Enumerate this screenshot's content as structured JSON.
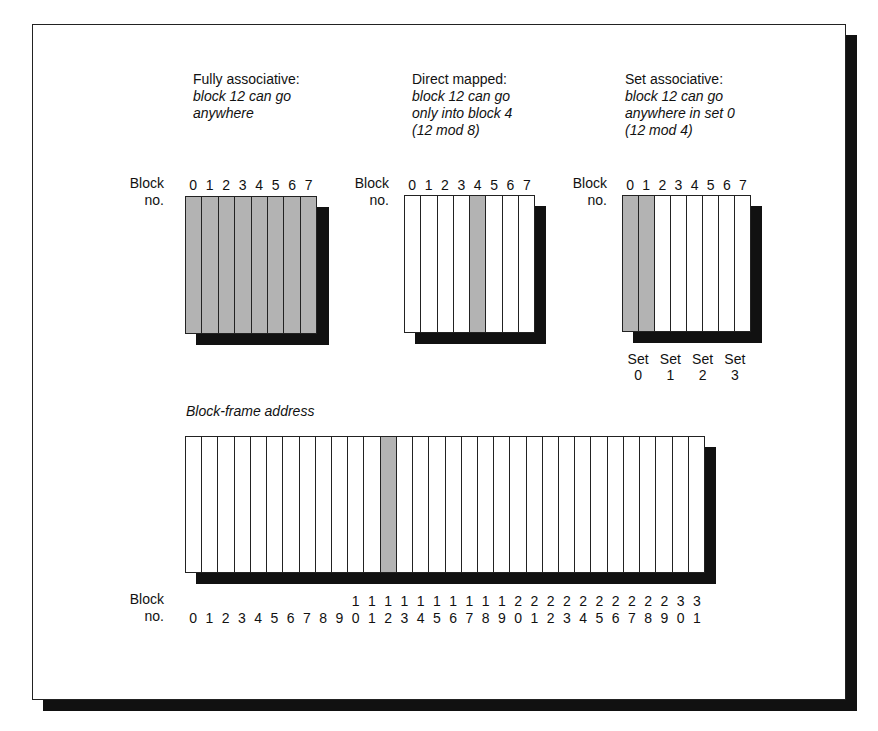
{
  "panels": {
    "fully": {
      "heading": "Fully associative:",
      "desc_line1": "block 12 can go",
      "desc_line2": "anywhere",
      "desc_line3": "",
      "block_label_1": "Block",
      "block_label_2": "no.",
      "blocks": [
        "0",
        "1",
        "2",
        "3",
        "4",
        "5",
        "6",
        "7"
      ],
      "shaded": [
        0,
        1,
        2,
        3,
        4,
        5,
        6,
        7
      ]
    },
    "direct": {
      "heading": "Direct mapped:",
      "desc_line1": "block 12 can go",
      "desc_line2": "only into block 4",
      "desc_line3": "(12 mod 8)",
      "block_label_1": "Block",
      "block_label_2": "no.",
      "blocks": [
        "0",
        "1",
        "2",
        "3",
        "4",
        "5",
        "6",
        "7"
      ],
      "shaded": [
        4
      ]
    },
    "set": {
      "heading": "Set associative:",
      "desc_line1": "block 12 can go",
      "desc_line2": "anywhere in set 0",
      "desc_line3": "(12 mod 4)",
      "block_label_1": "Block",
      "block_label_2": "no.",
      "blocks": [
        "0",
        "1",
        "2",
        "3",
        "4",
        "5",
        "6",
        "7"
      ],
      "shaded": [
        0,
        1
      ],
      "sets": [
        {
          "label": "Set",
          "num": "0"
        },
        {
          "label": "Set",
          "num": "1"
        },
        {
          "label": "Set",
          "num": "2"
        },
        {
          "label": "Set",
          "num": "3"
        }
      ]
    }
  },
  "memory": {
    "title": "Block-frame address",
    "block_label_1": "Block",
    "block_label_2": "no.",
    "tens": [
      "",
      "",
      "",
      "",
      "",
      "",
      "",
      "",
      "",
      "",
      "1",
      "1",
      "1",
      "1",
      "1",
      "1",
      "1",
      "1",
      "1",
      "1",
      "2",
      "2",
      "2",
      "2",
      "2",
      "2",
      "2",
      "2",
      "2",
      "2",
      "3",
      "3"
    ],
    "ones": [
      "0",
      "1",
      "2",
      "3",
      "4",
      "5",
      "6",
      "7",
      "8",
      "9",
      "0",
      "1",
      "2",
      "3",
      "4",
      "5",
      "6",
      "7",
      "8",
      "9",
      "0",
      "1",
      "2",
      "3",
      "4",
      "5",
      "6",
      "7",
      "8",
      "9",
      "0",
      "1"
    ],
    "shaded": [
      12
    ]
  },
  "colors": {
    "shade": "#b3b3b3",
    "shadow": "#111111",
    "line": "#222222"
  }
}
